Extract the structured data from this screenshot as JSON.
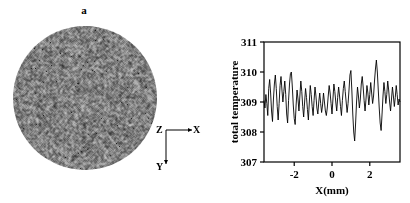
{
  "figure": {
    "panel_a": {
      "label": "a",
      "description": "speckle-disc",
      "axes_triad": {
        "origin_label": "Z",
        "horizontal_label": "X",
        "vertical_label": "Y"
      }
    },
    "panel_b": {
      "label": "b"
    }
  },
  "chart_data": {
    "type": "line",
    "title": "",
    "xlabel": "X(mm)",
    "ylabel": "total temperature",
    "xlim": [
      -3.6,
      3.6
    ],
    "ylim": [
      307,
      311
    ],
    "xticks": [
      -2,
      0,
      2
    ],
    "xticklabels": [
      "-2",
      "0",
      "2"
    ],
    "yticks": [
      307,
      308,
      309,
      310,
      311
    ],
    "yticklabels": [
      "307",
      "308",
      "309",
      "310",
      "311"
    ],
    "grid": false,
    "legend": null,
    "series": [
      {
        "name": "total temperature",
        "color": "#000000",
        "x": [
          -3.6,
          -3.55,
          -3.5,
          -3.45,
          -3.4,
          -3.35,
          -3.3,
          -3.25,
          -3.2,
          -3.15,
          -3.1,
          -3.05,
          -3.0,
          -2.95,
          -2.9,
          -2.85,
          -2.8,
          -2.75,
          -2.7,
          -2.65,
          -2.6,
          -2.55,
          -2.5,
          -2.45,
          -2.4,
          -2.35,
          -2.3,
          -2.25,
          -2.2,
          -2.15,
          -2.1,
          -2.05,
          -2.0,
          -1.95,
          -1.9,
          -1.85,
          -1.8,
          -1.75,
          -1.7,
          -1.65,
          -1.6,
          -1.55,
          -1.5,
          -1.45,
          -1.4,
          -1.35,
          -1.3,
          -1.25,
          -1.2,
          -1.15,
          -1.1,
          -1.05,
          -1.0,
          -0.95,
          -0.9,
          -0.85,
          -0.8,
          -0.75,
          -0.7,
          -0.65,
          -0.6,
          -0.55,
          -0.5,
          -0.45,
          -0.4,
          -0.35,
          -0.3,
          -0.25,
          -0.2,
          -0.15,
          -0.1,
          -0.05,
          0.0,
          0.05,
          0.1,
          0.15,
          0.2,
          0.25,
          0.3,
          0.35,
          0.4,
          0.45,
          0.5,
          0.55,
          0.6,
          0.65,
          0.7,
          0.75,
          0.8,
          0.85,
          0.9,
          0.95,
          1.0,
          1.05,
          1.1,
          1.15,
          1.2,
          1.25,
          1.3,
          1.35,
          1.4,
          1.45,
          1.5,
          1.55,
          1.6,
          1.65,
          1.7,
          1.75,
          1.8,
          1.85,
          1.9,
          1.95,
          2.0,
          2.05,
          2.1,
          2.15,
          2.2,
          2.25,
          2.3,
          2.35,
          2.4,
          2.45,
          2.5,
          2.55,
          2.6,
          2.65,
          2.7,
          2.75,
          2.8,
          2.85,
          2.9,
          2.95,
          3.0,
          3.05,
          3.1,
          3.15,
          3.2,
          3.25,
          3.3,
          3.35,
          3.4,
          3.45,
          3.5,
          3.55,
          3.6
        ],
        "y": [
          309.05,
          308.8,
          309.25,
          308.95,
          308.55,
          309.45,
          309.75,
          309.3,
          308.7,
          308.35,
          309.1,
          309.6,
          309.9,
          309.45,
          308.85,
          308.4,
          308.95,
          309.55,
          309.85,
          309.4,
          309.0,
          309.35,
          309.7,
          309.25,
          308.6,
          308.3,
          309.05,
          309.6,
          309.95,
          310.0,
          309.5,
          308.9,
          308.45,
          308.25,
          308.9,
          309.4,
          309.1,
          308.7,
          309.2,
          309.7,
          309.35,
          308.85,
          308.5,
          309.0,
          309.45,
          309.15,
          308.75,
          308.4,
          309.0,
          309.55,
          309.25,
          308.85,
          308.55,
          309.05,
          309.5,
          309.2,
          308.8,
          308.6,
          309.0,
          309.3,
          308.95,
          308.65,
          308.9,
          309.3,
          309.0,
          308.7,
          308.55,
          308.8,
          309.2,
          309.55,
          309.3,
          308.95,
          308.6,
          309.1,
          309.6,
          309.35,
          309.0,
          308.7,
          309.15,
          309.5,
          309.2,
          308.85,
          308.55,
          309.05,
          309.45,
          309.7,
          309.35,
          309.0,
          308.65,
          308.95,
          309.4,
          309.9,
          310.05,
          309.4,
          308.6,
          308.0,
          307.7,
          308.3,
          309.0,
          309.5,
          309.2,
          308.8,
          309.1,
          309.6,
          309.85,
          309.5,
          309.05,
          308.7,
          309.1,
          309.55,
          309.3,
          308.9,
          309.25,
          309.65,
          309.3,
          308.95,
          309.2,
          309.7,
          310.1,
          310.4,
          310.0,
          309.4,
          308.8,
          308.3,
          308.05,
          308.6,
          309.2,
          309.65,
          309.35,
          308.95,
          309.25,
          309.7,
          309.4,
          309.0,
          308.7,
          309.1,
          309.5,
          309.2,
          308.85,
          309.15,
          309.55,
          309.25,
          308.9,
          309.1,
          309.0
        ]
      }
    ]
  }
}
